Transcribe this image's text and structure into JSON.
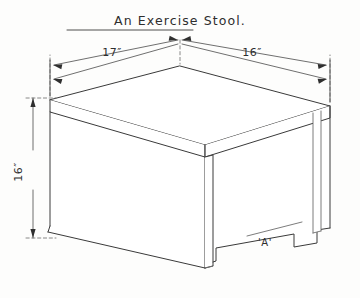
{
  "drawing": {
    "title": "An  Exercise  Stool.",
    "dimensions": {
      "top_left_edge": "17″",
      "top_right_edge": "16″",
      "height": "16″"
    },
    "part_labels": {
      "bottom_rail": "'A'"
    },
    "colors": {
      "paper": "#fdfdfc",
      "ink": "#3a3a3a",
      "ink_light": "#6d6d6d",
      "dimension_ink": "#4a4a4a"
    },
    "icons": {
      "arrow": "arrow-head-icon"
    }
  }
}
